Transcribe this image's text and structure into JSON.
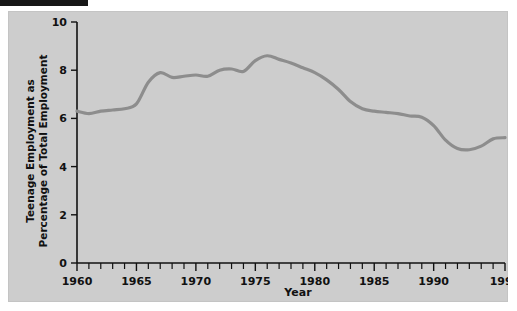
{
  "figure": {
    "background_color": "#cdcdcd",
    "page_background": "#ffffff",
    "line_color": "#8d8d8d",
    "axis_color": "#111111",
    "crop_bar_color": "#171717"
  },
  "axes": {
    "x_title": "Year",
    "y_title_line1": "Teenage Employment as",
    "y_title_line2": "Percentage of Total Employment",
    "x_tick_labels": [
      "1960",
      "1965",
      "1970",
      "1975",
      "1980",
      "1985",
      "1990",
      "1996"
    ],
    "y_tick_labels": [
      "0",
      "2",
      "4",
      "6",
      "8",
      "10"
    ]
  },
  "chart_data": {
    "type": "line",
    "title": "",
    "subtitle": "",
    "xlabel": "Year",
    "ylabel": "Teenage Employment as Percentage of Total Employment",
    "xlim": [
      1960,
      1996
    ],
    "ylim": [
      0,
      10
    ],
    "xticks": [
      1960,
      1961,
      1962,
      1963,
      1964,
      1965,
      1966,
      1967,
      1968,
      1969,
      1970,
      1971,
      1972,
      1973,
      1974,
      1975,
      1976,
      1977,
      1978,
      1979,
      1980,
      1981,
      1982,
      1983,
      1984,
      1985,
      1986,
      1987,
      1988,
      1989,
      1990,
      1991,
      1992,
      1993,
      1994,
      1995,
      1996
    ],
    "xtick_labels_shown": [
      1960,
      1965,
      1970,
      1975,
      1980,
      1985,
      1990,
      1996
    ],
    "yticks": [
      0,
      2,
      4,
      6,
      8,
      10
    ],
    "grid": false,
    "legend": null,
    "legend_position": "none",
    "series": [
      {
        "name": "Teenage Employment as Percentage of Total Employment",
        "color": "#8d8d8d",
        "x": [
          1960,
          1961,
          1962,
          1963,
          1964,
          1965,
          1966,
          1967,
          1968,
          1969,
          1970,
          1971,
          1972,
          1973,
          1974,
          1975,
          1976,
          1977,
          1978,
          1979,
          1980,
          1981,
          1982,
          1983,
          1984,
          1985,
          1986,
          1987,
          1988,
          1989,
          1990,
          1991,
          1992,
          1993,
          1994,
          1995,
          1996
        ],
        "values": [
          6.3,
          6.2,
          6.3,
          6.35,
          6.4,
          6.6,
          7.5,
          7.9,
          7.7,
          7.75,
          7.8,
          7.75,
          8.0,
          8.05,
          7.95,
          8.4,
          8.6,
          8.45,
          8.3,
          8.1,
          7.9,
          7.6,
          7.2,
          6.7,
          6.4,
          6.3,
          6.25,
          6.2,
          6.1,
          6.05,
          5.7,
          5.1,
          4.75,
          4.7,
          4.85,
          5.15,
          5.2
        ]
      }
    ]
  }
}
